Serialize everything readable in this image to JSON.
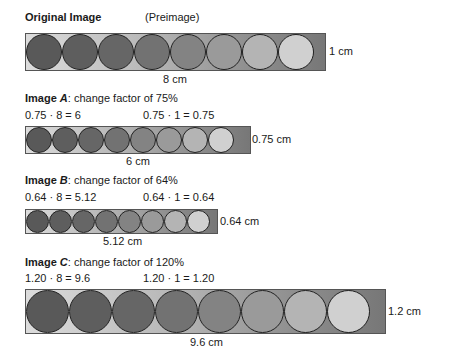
{
  "original": {
    "title": "Original Image",
    "subtitle": "(Preimage)",
    "width_label": "8 cm",
    "height_label": "1 cm"
  },
  "image_a": {
    "name_prefix": "Image ",
    "name_letter": "A",
    "caption": ": change factor of 75%",
    "calc_width": "0.75 · 8 = 6",
    "calc_height": "0.75 · 1 = 0.75",
    "width_label": "6 cm",
    "height_label": "0.75 cm"
  },
  "image_b": {
    "name_prefix": "Image ",
    "name_letter": "B",
    "caption": ": change factor of 64%",
    "calc_width": "0.64 · 8 = 5.12",
    "calc_height": "0.64 · 1 = 0.64",
    "width_label": "5.12 cm",
    "height_label": "0.64 cm"
  },
  "image_c": {
    "name_prefix": "Image ",
    "name_letter": "C",
    "caption": ": change factor of 120%",
    "calc_width": "1.20 · 8 = 9.6",
    "calc_height": "1.20 · 1 = 1.20",
    "width_label": "9.6 cm",
    "height_label": "1.2 cm"
  },
  "circle_colors": [
    "#595959",
    "#5e5e5e",
    "#666666",
    "#727272",
    "#838383",
    "#9a9a9a",
    "#b4b4b4",
    "#d0d0d0"
  ],
  "strips": [
    {
      "id": "original",
      "x": 25,
      "y": 33,
      "w": 301,
      "h": 38
    },
    {
      "id": "image_a",
      "x": 25,
      "y": 126,
      "w": 226,
      "h": 28
    },
    {
      "id": "image_b",
      "x": 25,
      "y": 209,
      "w": 193,
      "h": 25
    },
    {
      "id": "image_c",
      "x": 25,
      "y": 289,
      "w": 361,
      "h": 45
    }
  ]
}
